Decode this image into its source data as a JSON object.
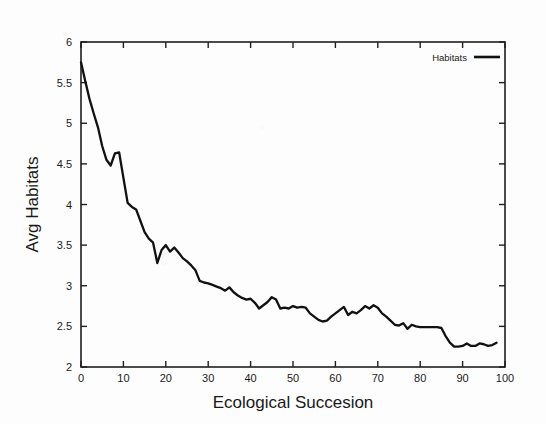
{
  "chart_data": {
    "type": "line",
    "title": "",
    "subtitle": "",
    "xlabel": "Ecological Succesion",
    "ylabel": "Avg Habitats",
    "xlim": [
      0,
      100
    ],
    "ylim": [
      2,
      6
    ],
    "xticks": [
      0,
      10,
      20,
      30,
      40,
      50,
      60,
      70,
      80,
      90,
      100
    ],
    "xtick_labels": [
      "0",
      "10",
      "20",
      "30",
      "40",
      "50",
      "60",
      "70",
      "80",
      "90",
      "100"
    ],
    "yticks": [
      2,
      2.5,
      3,
      3.5,
      4,
      4.5,
      5,
      5.5,
      6
    ],
    "ytick_labels": [
      "2",
      "2.5",
      "3",
      "3.5",
      "4",
      "4.5",
      "5",
      "5.5",
      "6"
    ],
    "grid": false,
    "legend_position": "top-right-inside",
    "legend_entries": [
      "Habitats"
    ],
    "line_color": "#111111",
    "frame_color": "#1f1f1f",
    "background_color": "#fdfdfd",
    "series": [
      {
        "name": "Habitats",
        "color": "#111111",
        "x": [
          0,
          1,
          2,
          3,
          4,
          5,
          6,
          7,
          8,
          9,
          10,
          11,
          12,
          13,
          14,
          15,
          16,
          17,
          18,
          19,
          20,
          21,
          22,
          23,
          24,
          25,
          26,
          27,
          28,
          29,
          30,
          31,
          32,
          33,
          34,
          35,
          36,
          37,
          38,
          39,
          40,
          41,
          42,
          43,
          44,
          45,
          46,
          47,
          48,
          49,
          50,
          51,
          52,
          53,
          54,
          55,
          56,
          57,
          58,
          59,
          60,
          61,
          62,
          63,
          64,
          65,
          66,
          67,
          68,
          69,
          70,
          71,
          72,
          73,
          74,
          75,
          76,
          77,
          78,
          79,
          80,
          81,
          82,
          83,
          84,
          85,
          86,
          87,
          88,
          89,
          90,
          91,
          92,
          93,
          94,
          95,
          96,
          97,
          98
        ],
        "y": [
          5.75,
          5.52,
          5.3,
          5.12,
          4.95,
          4.72,
          4.55,
          4.48,
          4.63,
          4.64,
          4.33,
          4.02,
          3.97,
          3.94,
          3.8,
          3.66,
          3.58,
          3.53,
          3.28,
          3.44,
          3.5,
          3.42,
          3.47,
          3.41,
          3.34,
          3.3,
          3.25,
          3.19,
          3.06,
          3.04,
          3.03,
          3.01,
          2.99,
          2.97,
          2.94,
          2.98,
          2.92,
          2.88,
          2.85,
          2.83,
          2.84,
          2.79,
          2.72,
          2.76,
          2.8,
          2.86,
          2.83,
          2.72,
          2.73,
          2.72,
          2.75,
          2.73,
          2.74,
          2.73,
          2.66,
          2.62,
          2.58,
          2.56,
          2.57,
          2.62,
          2.66,
          2.7,
          2.74,
          2.64,
          2.68,
          2.66,
          2.7,
          2.75,
          2.72,
          2.76,
          2.73,
          2.66,
          2.62,
          2.57,
          2.52,
          2.51,
          2.54,
          2.47,
          2.52,
          2.5,
          2.49,
          2.49,
          2.49,
          2.49,
          2.49,
          2.48,
          2.38,
          2.3,
          2.25,
          2.25,
          2.26,
          2.29,
          2.26,
          2.26,
          2.29,
          2.28,
          2.26,
          2.27,
          2.3
        ]
      }
    ]
  }
}
